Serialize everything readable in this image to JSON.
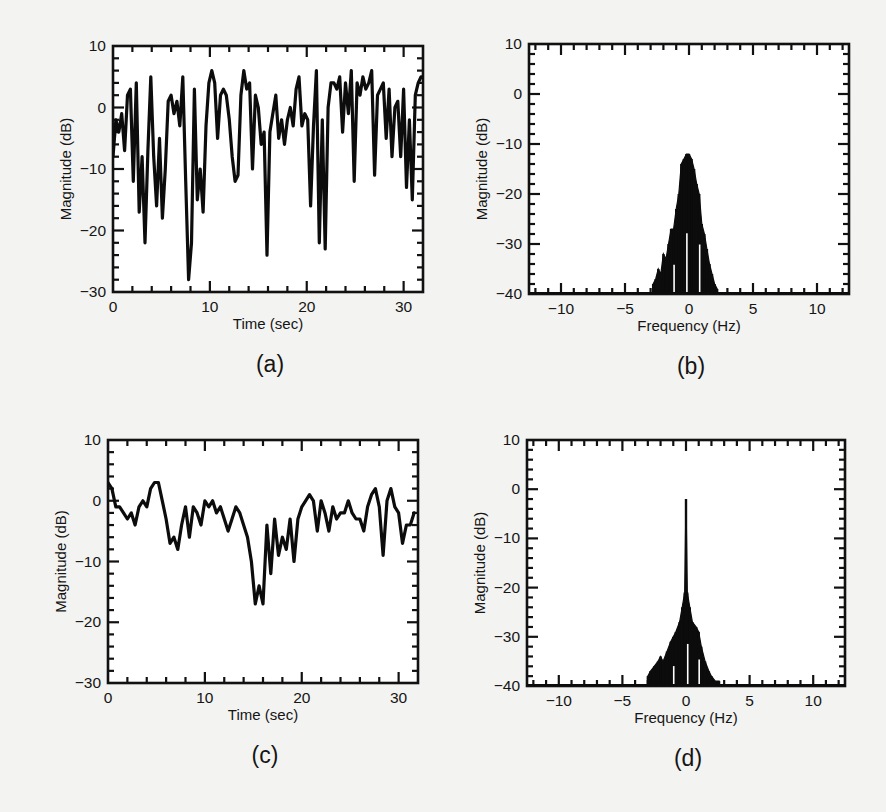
{
  "figure": {
    "background": "#f3f3f1",
    "ink": "#111111"
  },
  "chart_data": [
    {
      "id": "a",
      "panel_label": "(a)",
      "type": "line",
      "title": "",
      "xlabel": "Time (sec)",
      "ylabel": "Magnitude (dB)",
      "xlim": [
        0,
        32
      ],
      "ylim": [
        -30,
        10
      ],
      "xticks": [
        0,
        10,
        20,
        30
      ],
      "yticks": [
        -30,
        -20,
        -10,
        0,
        10
      ],
      "minor_x_step": 2,
      "minor_y_step": 2,
      "grid": false,
      "legend": null,
      "frame_px": {
        "left": 113,
        "top": 46,
        "right": 423,
        "bottom": 292
      },
      "x": [
        0,
        0.3,
        0.6,
        0.9,
        1.2,
        1.5,
        1.8,
        2.1,
        2.4,
        2.7,
        3.0,
        3.3,
        3.6,
        3.9,
        4.2,
        4.5,
        4.8,
        5.1,
        5.4,
        5.7,
        6.0,
        6.3,
        6.6,
        6.9,
        7.2,
        7.5,
        7.8,
        8.1,
        8.4,
        8.7,
        9.0,
        9.3,
        9.6,
        9.9,
        10.2,
        10.5,
        10.8,
        11.1,
        11.4,
        11.7,
        12.0,
        12.3,
        12.6,
        12.9,
        13.2,
        13.5,
        13.8,
        14.1,
        14.4,
        14.7,
        15.0,
        15.3,
        15.6,
        15.9,
        16.2,
        16.5,
        16.8,
        17.1,
        17.4,
        17.7,
        18.0,
        18.3,
        18.6,
        18.9,
        19.2,
        19.5,
        19.8,
        20.1,
        20.4,
        20.7,
        21.0,
        21.3,
        21.6,
        21.9,
        22.2,
        22.5,
        22.8,
        23.1,
        23.4,
        23.7,
        24.0,
        24.3,
        24.6,
        24.9,
        25.2,
        25.5,
        25.8,
        26.1,
        26.4,
        26.7,
        27.0,
        27.3,
        27.6,
        27.9,
        28.2,
        28.5,
        28.8,
        29.1,
        29.4,
        29.7,
        30.0,
        30.3,
        30.6,
        30.9,
        31.2,
        31.5,
        31.8
      ],
      "values": [
        -8,
        -2,
        -4,
        -1,
        -7,
        2,
        3,
        -12,
        4,
        -17,
        -8,
        -22,
        -7,
        5,
        -8,
        -16,
        -5,
        -18,
        -10,
        1,
        2,
        -1,
        1,
        -3,
        5,
        -12,
        -28,
        -22,
        3,
        -15,
        -10,
        -17,
        -3,
        4,
        6,
        4,
        -5,
        2,
        3,
        2,
        -2,
        -8,
        -12,
        -11,
        2,
        6,
        3,
        4,
        -10,
        2,
        0,
        -6,
        -4,
        -24,
        -4,
        -1,
        2,
        -5,
        -2,
        -6,
        -2,
        0,
        -3,
        3,
        5,
        -3,
        -1,
        -2,
        -16,
        -3,
        6,
        -22,
        -2,
        -23,
        0,
        4,
        4,
        3,
        5,
        -4,
        4,
        -1,
        6,
        -12,
        4,
        2,
        5,
        3,
        4,
        6,
        -11,
        2,
        3,
        4,
        -5,
        3,
        -8,
        0,
        1,
        -8,
        3,
        -13,
        -2,
        -15,
        2,
        4,
        5
      ],
      "notes": "Deep fading signal; sharp nulls near t≈7.5 s (~-28 dB), 16.5 s (~-24 dB), 20.7 s and 21.6 s (~-23 dB)."
    },
    {
      "id": "b",
      "panel_label": "(b)",
      "type": "area",
      "title": "",
      "xlabel": "Frequency (Hz)",
      "ylabel": "Magnitude (dB)",
      "xlim": [
        -12.5,
        12.5
      ],
      "ylim": [
        -40,
        10
      ],
      "xticks": [
        -10,
        -5,
        0,
        5,
        10
      ],
      "yticks": [
        -40,
        -30,
        -20,
        -10,
        0,
        10
      ],
      "minor_x_step": 1,
      "minor_y_step": 2,
      "grid": false,
      "legend": null,
      "frame_px": {
        "left": 529,
        "top": 44,
        "right": 849,
        "bottom": 294
      },
      "x": [
        -2.8,
        -2.6,
        -2.4,
        -2.2,
        -2.0,
        -1.8,
        -1.6,
        -1.4,
        -1.2,
        -1.0,
        -0.8,
        -0.6,
        -0.4,
        -0.2,
        0.0,
        0.2,
        0.4,
        0.6,
        0.8,
        1.0,
        1.2,
        1.4,
        1.6,
        1.8,
        2.0,
        2.2
      ],
      "values": [
        -38,
        -37,
        -35,
        -36,
        -32,
        -33,
        -30,
        -27,
        -27,
        -23,
        -20,
        -14,
        -13,
        -12,
        -12,
        -13,
        -15,
        -18,
        -20,
        -26,
        -28,
        -31,
        -34,
        -36,
        -38,
        -39
      ],
      "notes": "Dense band-limited spectrum centred at 0 Hz, peak ≈ -12 dB, roughly ±2.5 Hz wide."
    },
    {
      "id": "c",
      "panel_label": "(c)",
      "type": "line",
      "title": "",
      "xlabel": "Time (sec)",
      "ylabel": "Magnitude (dB)",
      "xlim": [
        0,
        32
      ],
      "ylim": [
        -30,
        10
      ],
      "xticks": [
        0,
        10,
        20,
        30
      ],
      "yticks": [
        -30,
        -20,
        -10,
        0,
        10
      ],
      "minor_x_step": 2,
      "minor_y_step": 2,
      "grid": false,
      "legend": null,
      "frame_px": {
        "left": 108,
        "top": 440,
        "right": 418,
        "bottom": 683
      },
      "x": [
        0,
        0.4,
        0.8,
        1.2,
        1.6,
        2.0,
        2.4,
        2.8,
        3.2,
        3.6,
        4.0,
        4.4,
        4.8,
        5.2,
        5.6,
        6.0,
        6.4,
        6.8,
        7.2,
        7.6,
        8.0,
        8.4,
        8.8,
        9.2,
        9.6,
        10.0,
        10.4,
        10.8,
        11.2,
        11.6,
        12.0,
        12.4,
        12.8,
        13.2,
        13.6,
        14.0,
        14.4,
        14.8,
        15.2,
        15.6,
        16.0,
        16.4,
        16.8,
        17.2,
        17.6,
        18.0,
        18.4,
        18.8,
        19.2,
        19.6,
        20.0,
        20.4,
        20.8,
        21.2,
        21.6,
        22.0,
        22.4,
        22.8,
        23.2,
        23.6,
        24.0,
        24.4,
        24.8,
        25.2,
        25.6,
        26.0,
        26.4,
        26.8,
        27.2,
        27.6,
        28.0,
        28.4,
        28.8,
        29.2,
        29.6,
        30.0,
        30.4,
        30.8,
        31.2,
        31.6
      ],
      "values": [
        3,
        2,
        -1,
        -1,
        -2,
        -3,
        -2,
        -4,
        -1,
        0,
        -1,
        2,
        3,
        3,
        0,
        -3,
        -7,
        -6,
        -8,
        -4,
        -1,
        -6,
        -1,
        -2,
        -4,
        0,
        -1,
        0,
        -2,
        -1,
        -3,
        -5,
        -3,
        -1,
        -2,
        -4,
        -6,
        -10,
        -17,
        -14,
        -17,
        -4,
        -12,
        -3,
        -9,
        -6,
        -8,
        -3,
        -10,
        -3,
        -1,
        0,
        1,
        0,
        -5,
        0,
        -2,
        -5,
        -1,
        -3,
        -2,
        -2,
        0,
        -2,
        -3,
        -3,
        -5,
        -1,
        1,
        2,
        -1,
        -9,
        0,
        2,
        -1,
        -2,
        -7,
        -4,
        -4,
        -2
      ],
      "notes": "Much milder fading; deepest dip ≈ -17 dB near t≈15 s."
    },
    {
      "id": "d",
      "panel_label": "(d)",
      "type": "area",
      "title": "",
      "xlabel": "Frequency (Hz)",
      "ylabel": "Magnitude (dB)",
      "xlim": [
        -12.5,
        12.5
      ],
      "ylim": [
        -40,
        10
      ],
      "xticks": [
        -10,
        -5,
        0,
        5,
        10
      ],
      "yticks": [
        -40,
        -30,
        -20,
        -10,
        0,
        10
      ],
      "minor_x_step": 1,
      "minor_y_step": 2,
      "grid": false,
      "legend": null,
      "frame_px": {
        "left": 527,
        "top": 440,
        "right": 845,
        "bottom": 686
      },
      "x": [
        -3.0,
        -2.8,
        -2.5,
        -2.2,
        -2.0,
        -1.8,
        -1.5,
        -1.2,
        -1.0,
        -0.8,
        -0.5,
        -0.3,
        -0.1,
        0.0,
        0.1,
        0.3,
        0.5,
        0.8,
        1.0,
        1.2,
        1.5,
        1.8,
        2.0,
        2.3,
        2.6
      ],
      "values": [
        -38,
        -37,
        -36,
        -35,
        -34,
        -35,
        -33,
        -31,
        -30,
        -29,
        -27,
        -24,
        -21,
        -2,
        -21,
        -24,
        -27,
        -28,
        -29,
        -32,
        -35,
        -37,
        -38,
        -39,
        -39
      ],
      "notes": "Strong line-of-sight spike at 0 Hz reaching ≈ -2 dB above a diffuse spectrum peaking near -21 dB."
    }
  ]
}
